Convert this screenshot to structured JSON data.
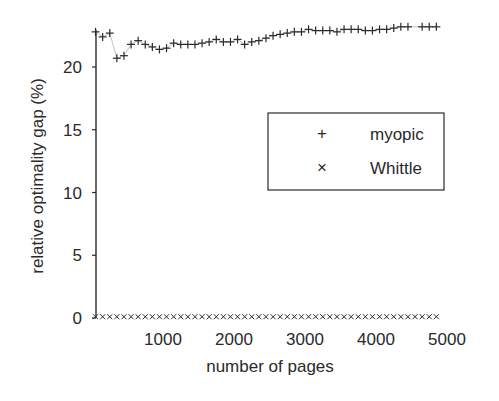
{
  "chart_data": {
    "type": "scatter",
    "title": "",
    "xlabel": "number of pages",
    "ylabel": "relative optimality gap (%)",
    "xlim": [
      0,
      5000
    ],
    "ylim": [
      0,
      23
    ],
    "xticks": [
      1000,
      2000,
      3000,
      4000,
      5000
    ],
    "yticks": [
      0,
      5,
      10,
      15,
      20
    ],
    "grid": false,
    "legend_position": "center-right",
    "series": [
      {
        "name": "myopic",
        "marker": "+",
        "x": [
          50,
          150,
          250,
          350,
          450,
          550,
          650,
          750,
          850,
          950,
          1050,
          1150,
          1250,
          1350,
          1450,
          1550,
          1650,
          1750,
          1850,
          1950,
          2050,
          2150,
          2250,
          2350,
          2450,
          2550,
          2650,
          2750,
          2850,
          2950,
          3050,
          3150,
          3250,
          3350,
          3450,
          3550,
          3650,
          3750,
          3850,
          3950,
          4050,
          4150,
          4250,
          4350,
          4450,
          4650,
          4750,
          4850
        ],
        "values": [
          22.8,
          22.4,
          22.7,
          20.7,
          20.9,
          21.8,
          22.1,
          21.8,
          21.6,
          21.4,
          21.5,
          21.9,
          21.8,
          21.8,
          21.8,
          21.9,
          22.0,
          22.2,
          22.0,
          22.0,
          22.2,
          21.8,
          22.0,
          22.1,
          22.3,
          22.5,
          22.6,
          22.7,
          22.8,
          22.8,
          23.0,
          22.9,
          22.9,
          22.9,
          22.8,
          23.0,
          23.0,
          23.0,
          22.9,
          22.9,
          23.0,
          23.0,
          23.1,
          23.2,
          23.2,
          23.2,
          23.2,
          23.2
        ]
      },
      {
        "name": "Whittle",
        "marker": "x",
        "x": [
          50,
          150,
          250,
          350,
          450,
          550,
          650,
          750,
          850,
          950,
          1050,
          1150,
          1250,
          1350,
          1450,
          1550,
          1650,
          1750,
          1850,
          1950,
          2050,
          2150,
          2250,
          2350,
          2450,
          2550,
          2650,
          2750,
          2850,
          2950,
          3050,
          3150,
          3250,
          3350,
          3450,
          3550,
          3650,
          3750,
          3850,
          3950,
          4050,
          4150,
          4250,
          4350,
          4450,
          4550,
          4650,
          4750,
          4850
        ],
        "values": [
          0.1,
          0.1,
          0.1,
          0.1,
          0.1,
          0.1,
          0.1,
          0.1,
          0.1,
          0.1,
          0.1,
          0.1,
          0.1,
          0.1,
          0.1,
          0.1,
          0.1,
          0.1,
          0.1,
          0.1,
          0.1,
          0.1,
          0.1,
          0.1,
          0.1,
          0.1,
          0.1,
          0.1,
          0.1,
          0.1,
          0.1,
          0.1,
          0.1,
          0.1,
          0.1,
          0.1,
          0.1,
          0.1,
          0.1,
          0.1,
          0.1,
          0.1,
          0.1,
          0.1,
          0.1,
          0.1,
          0.1,
          0.1,
          0.1
        ]
      }
    ]
  },
  "legend": {
    "items": [
      {
        "marker": "+",
        "label": "myopic"
      },
      {
        "marker": "×",
        "label": "Whittle"
      }
    ]
  },
  "colors": {
    "ink": "#2a2a2a",
    "background": "#ffffff"
  }
}
